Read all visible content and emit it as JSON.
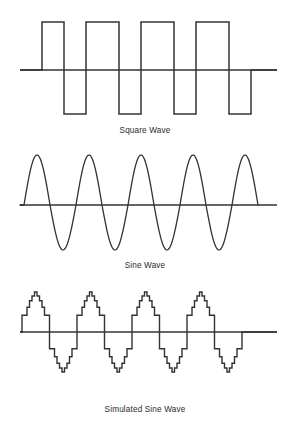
{
  "figure": {
    "background_color": "#ffffff",
    "stroke_color": "#333333",
    "label_color": "#2b2b2b",
    "width": 294,
    "height": 423
  },
  "panels": [
    {
      "id": "square-wave",
      "label": "Square Wave",
      "label_x": 145,
      "label_y": 133,
      "axis": {
        "x1": 20,
        "x2": 277,
        "y": 70
      },
      "cycles": 4
    },
    {
      "id": "sine-wave",
      "label": "Sine Wave",
      "label_x": 145,
      "label_y": 268,
      "axis": {
        "x1": 20,
        "x2": 277,
        "y": 205
      },
      "cycles": 4.5
    },
    {
      "id": "simulated-sine-wave",
      "label": "Simulated Sine Wave",
      "label_x": 145,
      "label_y": 412,
      "axis": {
        "x1": 20,
        "x2": 277,
        "y": 332
      },
      "cycles": 4
    }
  ],
  "chart_data": [
    {
      "type": "line",
      "id": "square-wave",
      "title": "Square Wave",
      "xlabel": "",
      "ylabel": "",
      "grid": false,
      "legend": "none",
      "xlim": [
        0,
        257
      ],
      "ylim": [
        -1,
        1
      ],
      "amplitude": 1,
      "period_px": 55,
      "start_x": 22,
      "baseline_y": 70,
      "peak_y": 22,
      "trough_y": 114,
      "description": "Ideal square wave, 4 cycles, alternating between +1 and -1 with instantaneous transitions.",
      "points": [
        [
          0,
          0
        ],
        [
          22,
          0
        ],
        [
          22,
          1
        ],
        [
          44,
          1
        ],
        [
          44,
          -1
        ],
        [
          66,
          -1
        ],
        [
          66,
          1
        ],
        [
          77,
          1
        ],
        [
          99,
          1
        ],
        [
          99,
          -1
        ],
        [
          121,
          -1
        ],
        [
          121,
          1
        ],
        [
          132,
          1
        ],
        [
          154,
          1
        ],
        [
          154,
          -1
        ],
        [
          176,
          -1
        ],
        [
          176,
          1
        ],
        [
          187,
          1
        ],
        [
          209,
          1
        ],
        [
          209,
          -1
        ],
        [
          231,
          -1
        ],
        [
          231,
          0
        ],
        [
          257,
          0
        ]
      ]
    },
    {
      "type": "line",
      "id": "sine-wave",
      "title": "Sine Wave",
      "xlabel": "",
      "ylabel": "",
      "grid": false,
      "legend": "none",
      "xlim": [
        0,
        257
      ],
      "ylim": [
        -1,
        1
      ],
      "amplitude": 1,
      "period_px": 52,
      "start_x": 22,
      "baseline_y": 205,
      "peak_y": 155,
      "trough_y": 250,
      "cycles": 4.5,
      "description": "Smooth sinusoid, amplitude 1, about 4.5 cycles drawn across the axis.",
      "samples_per_cycle": 48
    },
    {
      "type": "line",
      "id": "simulated-sine-wave",
      "title": "Simulated Sine Wave",
      "xlabel": "",
      "ylabel": "",
      "grid": false,
      "legend": "none",
      "xlim": [
        0,
        257
      ],
      "ylim": [
        -1,
        1
      ],
      "amplitude": 1,
      "period_px": 55,
      "start_x": 22,
      "baseline_y": 332,
      "peak_y": 292,
      "trough_y": 372,
      "cycles": 4,
      "step_count_per_half": 11,
      "description": "Stepped (quantized) approximation of a sine wave; each half-cycle is built from 11 discrete voltage steps forming a staircase envelope.",
      "step_levels_half_cycle": [
        0.42,
        0.42,
        0.62,
        0.78,
        0.9,
        1.0,
        0.9,
        0.78,
        0.62,
        0.42,
        0.42
      ]
    }
  ]
}
